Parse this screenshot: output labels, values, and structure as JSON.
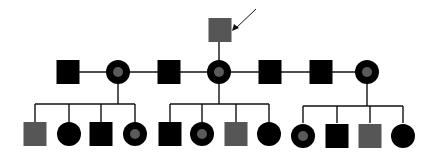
{
  "diagram": {
    "type": "pedigree",
    "colors": {
      "line": "#111111",
      "affected": "#000000",
      "gray": "#565656",
      "carrier_dot": "#5a5a5a",
      "background": "#ffffff"
    },
    "proband": {
      "id": "I-1",
      "sex": "male",
      "fill": "gray",
      "x": 220,
      "y": 30,
      "arrow": true
    },
    "generation2": [
      {
        "id": "II-1",
        "sex": "male",
        "fill": "black",
        "x": 68,
        "y": 72
      },
      {
        "id": "II-2",
        "sex": "female",
        "fill": "black-dot",
        "x": 118,
        "y": 72
      },
      {
        "id": "II-3",
        "sex": "male",
        "fill": "black",
        "x": 169,
        "y": 72
      },
      {
        "id": "II-4",
        "sex": "female",
        "fill": "black-dot",
        "x": 219,
        "y": 72
      },
      {
        "id": "II-5",
        "sex": "male",
        "fill": "black",
        "x": 270,
        "y": 72
      },
      {
        "id": "II-6",
        "sex": "male",
        "fill": "black",
        "x": 321,
        "y": 72
      },
      {
        "id": "II-7",
        "sex": "female",
        "fill": "black-dot",
        "x": 367,
        "y": 72
      }
    ],
    "families": [
      {
        "parent_x": 118,
        "children": [
          {
            "id": "III-1",
            "sex": "male",
            "fill": "gray",
            "x": 35
          },
          {
            "id": "III-2",
            "sex": "female",
            "fill": "black",
            "x": 69
          },
          {
            "id": "III-3",
            "sex": "male",
            "fill": "black",
            "x": 101
          },
          {
            "id": "III-4",
            "sex": "female",
            "fill": "black-dot",
            "x": 135
          }
        ]
      },
      {
        "parent_x": 219,
        "children": [
          {
            "id": "III-5",
            "sex": "male",
            "fill": "black",
            "x": 170
          },
          {
            "id": "III-6",
            "sex": "female",
            "fill": "black-dot",
            "x": 202
          },
          {
            "id": "III-7",
            "sex": "male",
            "fill": "gray",
            "x": 236
          },
          {
            "id": "III-8",
            "sex": "female",
            "fill": "black",
            "x": 269
          }
        ]
      },
      {
        "parent_x": 367,
        "children": [
          {
            "id": "III-9",
            "sex": "female",
            "fill": "black-dot",
            "x": 303
          },
          {
            "id": "III-10",
            "sex": "male",
            "fill": "black",
            "x": 337
          },
          {
            "id": "III-11",
            "sex": "male",
            "fill": "gray",
            "x": 370
          },
          {
            "id": "III-12",
            "sex": "female",
            "fill": "black",
            "x": 403
          }
        ]
      }
    ]
  }
}
